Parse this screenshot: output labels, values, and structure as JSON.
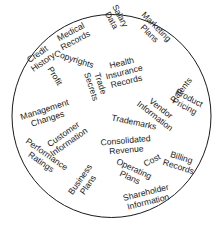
{
  "diagram": {
    "shape": "circle",
    "stroke_color": "#1a1a1a",
    "text_color": "#1a1a1a",
    "background": "#ffffff",
    "labels": [
      {
        "id": "credit-history",
        "lines": [
          "Credit",
          "History"
        ],
        "x": 40,
        "y": 58,
        "rotate": -35
      },
      {
        "id": "medical-records",
        "lines": [
          "Medical",
          "Records"
        ],
        "x": 73,
        "y": 36,
        "rotate": -28
      },
      {
        "id": "salary-data",
        "lines": [
          "Salary",
          "Data"
        ],
        "x": 116,
        "y": 18,
        "rotate": 62
      },
      {
        "id": "marketing-plans",
        "lines": [
          "Marketing",
          "Plans"
        ],
        "x": 153,
        "y": 30,
        "rotate": 45
      },
      {
        "id": "copyrights",
        "lines": [
          "Copyrights"
        ],
        "x": 74,
        "y": 59,
        "rotate": 18
      },
      {
        "id": "health-insurance-records",
        "lines": [
          "Health",
          "Insurance",
          "Records"
        ],
        "x": 124,
        "y": 72,
        "rotate": -14
      },
      {
        "id": "patents",
        "lines": [
          "Patents"
        ],
        "x": 181,
        "y": 90,
        "rotate": -52
      },
      {
        "id": "profit",
        "lines": [
          "Profit"
        ],
        "x": 55,
        "y": 76,
        "rotate": 58
      },
      {
        "id": "trade-secrets",
        "lines": [
          "Trade",
          "Secrets"
        ],
        "x": 96,
        "y": 85,
        "rotate": 72
      },
      {
        "id": "product-pricing",
        "lines": [
          "Product",
          "Pricing"
        ],
        "x": 187,
        "y": 102,
        "rotate": 28
      },
      {
        "id": "management-changes",
        "lines": [
          "Management",
          "Changes"
        ],
        "x": 46,
        "y": 114,
        "rotate": -18
      },
      {
        "id": "vendor-information",
        "lines": [
          "Vendor",
          "Information"
        ],
        "x": 158,
        "y": 112,
        "rotate": 38
      },
      {
        "id": "customer-information",
        "lines": [
          "Customer",
          "Information"
        ],
        "x": 66,
        "y": 138,
        "rotate": -35
      },
      {
        "id": "trademarks",
        "lines": [
          "Trademarks"
        ],
        "x": 134,
        "y": 122,
        "rotate": 12
      },
      {
        "id": "consolidated-revenue",
        "lines": [
          "Consolidated",
          "Revenue"
        ],
        "x": 126,
        "y": 145,
        "rotate": -5
      },
      {
        "id": "performance-ratings",
        "lines": [
          "Performance",
          "Ratings"
        ],
        "x": 44,
        "y": 158,
        "rotate": 35
      },
      {
        "id": "cost",
        "lines": [
          "Cost"
        ],
        "x": 152,
        "y": 160,
        "rotate": -28
      },
      {
        "id": "billing-records",
        "lines": [
          "Billing",
          "Records"
        ],
        "x": 180,
        "y": 162,
        "rotate": 18
      },
      {
        "id": "operating-plans",
        "lines": [
          "Operating",
          "Plans"
        ],
        "x": 132,
        "y": 173,
        "rotate": 25
      },
      {
        "id": "business-plans",
        "lines": [
          "Business",
          "Plans"
        ],
        "x": 84,
        "y": 182,
        "rotate": -55
      },
      {
        "id": "shareholder-information",
        "lines": [
          "Shareholder",
          "Information"
        ],
        "x": 147,
        "y": 197,
        "rotate": -14
      }
    ]
  }
}
